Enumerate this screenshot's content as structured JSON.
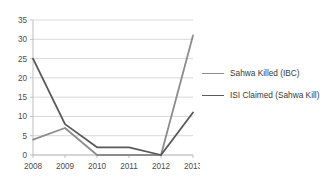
{
  "chart_data": {
    "type": "line",
    "title": "",
    "xlabel": "",
    "ylabel": "",
    "categories": [
      "2008",
      "2009",
      "2010",
      "2011",
      "2012",
      "2013"
    ],
    "x": [
      2008,
      2009,
      2010,
      2011,
      2012,
      2013
    ],
    "ylim": [
      0,
      35
    ],
    "yticks": [
      0,
      5,
      10,
      15,
      20,
      25,
      30,
      35
    ],
    "ytick_labels": [
      "0",
      "5",
      "10",
      "15",
      "20",
      "25",
      "30",
      "35"
    ],
    "grid": "horizontal",
    "legend_position": "right",
    "series": [
      {
        "name": "Sahwa Killed (IBC)",
        "color": "#8c8c8c",
        "values": [
          4,
          7,
          0,
          0,
          0,
          31
        ]
      },
      {
        "name": "ISI Claimed (Sahwa Kill)",
        "color": "#595959",
        "values": [
          25,
          8,
          2,
          2,
          0,
          11
        ]
      }
    ]
  },
  "legend": {
    "items": [
      {
        "label": "Sahwa Killed (IBC)"
      },
      {
        "label": "ISI Claimed (Sahwa Kill)"
      }
    ]
  },
  "colors": {
    "series_1": "#8c8c8c",
    "series_2": "#595959",
    "gridline": "#d9d9d9",
    "axis": "#bfbfbf",
    "tick_text": "#4d4d4d",
    "background": "#ffffff"
  }
}
